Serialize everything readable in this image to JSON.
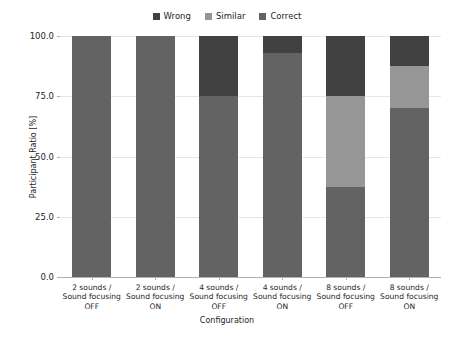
{
  "chart_data": {
    "type": "bar",
    "subtype": "stacked-bar-100-percent",
    "title": "",
    "xlabel": "Configuration",
    "ylabel": "Participant Ratio [%]",
    "ylim": [
      0,
      100
    ],
    "yticks": [
      "0.0",
      "25.0",
      "50.0",
      "75.0",
      "100.0"
    ],
    "ytick_values": [
      0,
      25,
      50,
      75,
      100
    ],
    "grid": true,
    "legend_position": "top-center",
    "categories": [
      "2 sounds / Sound focusing OFF",
      "2 sounds / Sound focusing ON",
      "4 sounds / Sound focusing OFF",
      "4 sounds / Sound focusing ON",
      "8 sounds / Sound focusing OFF",
      "8 sounds / Sound focusing ON"
    ],
    "category_lines": [
      [
        "2 sounds /",
        "Sound focusing",
        "OFF"
      ],
      [
        "2 sounds /",
        "Sound focusing",
        "ON"
      ],
      [
        "4 sounds /",
        "Sound focusing",
        "OFF"
      ],
      [
        "4 sounds /",
        "Sound focusing",
        "ON"
      ],
      [
        "8 sounds /",
        "Sound focusing",
        "OFF"
      ],
      [
        "8 sounds /",
        "Sound focusing",
        "ON"
      ]
    ],
    "series": [
      {
        "name": "Correct",
        "color": "#636363",
        "values": [
          100.0,
          100.0,
          75.0,
          93.0,
          37.5,
          70.0
        ]
      },
      {
        "name": "Similar",
        "color": "#969696",
        "values": [
          0.0,
          0.0,
          0.0,
          0.0,
          37.5,
          17.5
        ]
      },
      {
        "name": "Wrong",
        "color": "#414141",
        "values": [
          0.0,
          0.0,
          25.0,
          7.0,
          25.0,
          12.5
        ]
      }
    ],
    "stack_order_bottom_to_top": [
      "Correct",
      "Similar",
      "Wrong"
    ]
  },
  "legend": {
    "items": [
      {
        "label": "Wrong",
        "color": "#414141"
      },
      {
        "label": "Similar",
        "color": "#969696"
      },
      {
        "label": "Correct",
        "color": "#636363"
      }
    ]
  },
  "colors": {
    "background": "#ffffff",
    "grid": "#e6e6e6",
    "axis": "#b0b0b0",
    "text": "#262626"
  }
}
